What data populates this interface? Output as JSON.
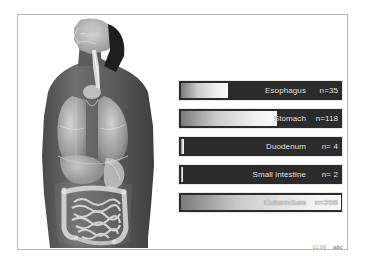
{
  "slide": {
    "background_color": "#ffffff",
    "frame_color": "#b9b9b9",
    "bar_background_color": "#2b2b2b",
    "bar_text_color": "#f0f0f0"
  },
  "illustration": {
    "name": "human-torso-gi-anatomy",
    "description": "Grayscale anatomical illustration of a human head, neck and torso showing the upper airway, esophagus, lungs, liver, stomach, small intestine and colon"
  },
  "chart_data": {
    "type": "bar",
    "title": "",
    "subtitle": "",
    "xlabel": "",
    "ylabel": "",
    "orientation": "horizontal",
    "grid": false,
    "legend": "none",
    "categories": [
      "Esophagus",
      "Stomach",
      "Duodenum",
      "Small intestine",
      "Colorectum"
    ],
    "values": [
      35,
      118,
      4,
      2,
      208
    ],
    "xlim": [
      0,
      208
    ],
    "value_prefix": "n=",
    "bars": [
      {
        "label": "Esophagus",
        "count_text": "n=35",
        "value": 35,
        "fill_percent": 29
      },
      {
        "label": "Stomach",
        "count_text": "n=118",
        "value": 118,
        "fill_percent": 59
      },
      {
        "label": "Duodenum",
        "count_text": "n= 4",
        "value": 4,
        "fill_percent": 2
      },
      {
        "label": "Small intestine",
        "count_text": "n= 2",
        "value": 2,
        "fill_percent": 1.5
      },
      {
        "label": "Colorectum",
        "count_text": "n=208",
        "value": 208,
        "fill_percent": 98
      }
    ]
  },
  "footer": {
    "timestamp": "01:09",
    "logo": "abc"
  }
}
